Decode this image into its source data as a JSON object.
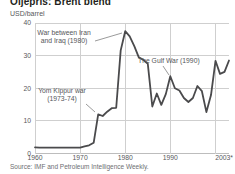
{
  "title": "Oljepris: Brent blend",
  "y_axis_unit": "USD/barrel",
  "source": "Source: IMF and Petroleum Intelligence Weekly.",
  "colors": {
    "line": "#4a4a4c",
    "grid": "#cfcfcf",
    "baseline": "#bdbdbd",
    "axis_text": "#58595b",
    "annotation_text": "#55565a",
    "pointer_line": "#808080",
    "title_text": "#231f20",
    "background": "#ffffff"
  },
  "chart_data": {
    "type": "line",
    "title": "Oljepris: Brent blend",
    "ylabel": "USD/barrel",
    "xlabel": "",
    "ylim": [
      0,
      40
    ],
    "xlim": [
      1960,
      2003
    ],
    "grid": true,
    "legend": "none",
    "yticks": [
      0,
      10,
      20,
      30,
      40
    ],
    "x_gridlines": [
      1970,
      1980,
      1990,
      2000
    ],
    "xticks": [
      {
        "label": "1960",
        "year": 1960
      },
      {
        "label": "1970",
        "year": 1970
      },
      {
        "label": "1980",
        "year": 1980
      },
      {
        "label": "1990",
        "year": 1990
      },
      {
        "label": "2003*",
        "year": 2003
      }
    ],
    "x": [
      1960,
      1961,
      1962,
      1963,
      1964,
      1965,
      1966,
      1967,
      1968,
      1969,
      1970,
      1971,
      1972,
      1973,
      1974,
      1975,
      1976,
      1977,
      1978,
      1979,
      1980,
      1981,
      1982,
      1983,
      1984,
      1985,
      1986,
      1987,
      1988,
      1989,
      1990,
      1991,
      1992,
      1993,
      1994,
      1995,
      1996,
      1997,
      1998,
      1999,
      2000,
      2001,
      2002,
      2003
    ],
    "values": [
      1.9,
      1.8,
      1.8,
      1.8,
      1.8,
      1.8,
      1.8,
      1.8,
      1.8,
      1.8,
      1.8,
      2.2,
      2.5,
      3.3,
      12.0,
      11.5,
      12.8,
      13.9,
      14.0,
      31.6,
      37.5,
      35.9,
      32.9,
      29.5,
      28.7,
      27.5,
      14.4,
      18.4,
      14.9,
      18.2,
      23.7,
      20.0,
      19.3,
      17.0,
      15.8,
      17.0,
      20.7,
      19.1,
      12.7,
      17.9,
      28.4,
      24.4,
      25.0,
      28.5
    ],
    "annotations": [
      {
        "id": "iran_iraq",
        "lines": [
          "War between Iran",
          "and Iraq (1980)"
        ],
        "target_year": 1980,
        "target_value": 37.5
      },
      {
        "id": "gulf_war",
        "lines": [
          "The Gulf War (1990)"
        ],
        "target_year": 1990,
        "target_value": 23.7
      },
      {
        "id": "yom_kippur",
        "lines": [
          "Yom Kippur war",
          "(1973-74)"
        ],
        "target_year": 1974,
        "target_value": 12.0
      }
    ]
  }
}
